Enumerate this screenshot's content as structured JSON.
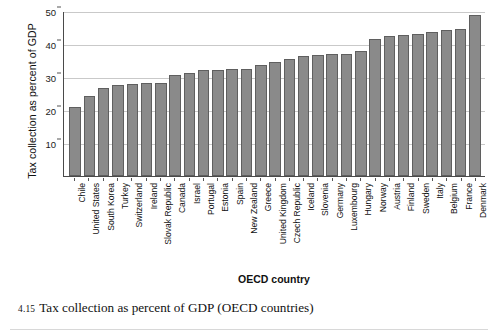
{
  "figure": {
    "caption_number": "4.15",
    "caption_text": "Tax collection as percent of GDP (OECD countries)"
  },
  "chart_data": {
    "type": "bar",
    "title": "",
    "xlabel": "OECD country",
    "ylabel": "Tax collection as percent of GDP",
    "ylim": [
      0,
      50
    ],
    "yticks": [
      10,
      20,
      30,
      40,
      50
    ],
    "ytick_labels": [
      "10",
      "20",
      "30",
      "40",
      "50"
    ],
    "grid": true,
    "legend": false,
    "bar_color": "#8a8a8a",
    "bar_edge_color": "#5f5f5f",
    "grid_color": "#c9c9c9",
    "axis_color": "#4a4a4a",
    "categories": [
      "Chile",
      "United States",
      "South Korea",
      "Turkey",
      "Switzerland",
      "Ireland",
      "Slovak Republic",
      "Canada",
      "Israel",
      "Portugal",
      "Estonia",
      "Spain",
      "New Zealand",
      "Greece",
      "United Kingdom",
      "Czech Republic",
      "Iceland",
      "Slovenia",
      "Germany",
      "Luxembourg",
      "Hungary",
      "Norway",
      "Austria",
      "Finland",
      "Sweden",
      "Italy",
      "Belgium",
      "France",
      "Denmark"
    ],
    "values": [
      20.8,
      24.3,
      26.7,
      27.6,
      27.9,
      28.1,
      28.3,
      30.6,
      31.2,
      32.0,
      32.1,
      32.3,
      32.4,
      33.7,
      34.4,
      35.4,
      36.5,
      36.8,
      36.9,
      37.1,
      38.0,
      41.6,
      42.5,
      42.8,
      43.1,
      43.6,
      44.2,
      44.4,
      48.9
    ]
  }
}
